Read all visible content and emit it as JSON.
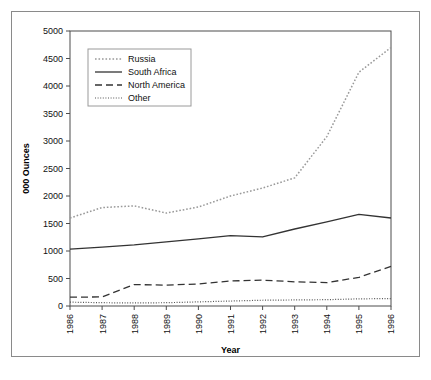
{
  "chart_data": {
    "type": "line",
    "title": "",
    "xlabel": "Year",
    "ylabel": "000 Ounces",
    "xlim": [
      1986,
      1996
    ],
    "ylim": [
      0,
      5000
    ],
    "ytick_step": 500,
    "grid": false,
    "legend_position": "top-left",
    "categories": [
      1986,
      1987,
      1988,
      1989,
      1990,
      1991,
      1992,
      1993,
      1994,
      1995,
      1996
    ],
    "xticklabels": [
      "1986",
      "1987",
      "1988",
      "1989",
      "1990",
      "1991",
      "1992",
      "1993",
      "1994",
      "1995",
      "1996"
    ],
    "yticklabels": [
      "0",
      "500",
      "1000",
      "1500",
      "2000",
      "2500",
      "3000",
      "3500",
      "4000",
      "4500",
      "5000"
    ],
    "series": [
      {
        "name": "Russia",
        "style": "dotted",
        "color": "#999999",
        "values": [
          1600,
          1790,
          1820,
          1690,
          1800,
          2000,
          2145,
          2330,
          3080,
          4250,
          4700
        ]
      },
      {
        "name": "South Africa",
        "style": "solid",
        "color": "#333333",
        "values": [
          1035,
          1070,
          1110,
          1165,
          1220,
          1280,
          1255,
          1400,
          1530,
          1665,
          1600
        ]
      },
      {
        "name": "North America",
        "style": "dashed",
        "color": "#333333",
        "values": [
          160,
          165,
          390,
          380,
          400,
          455,
          470,
          440,
          425,
          520,
          720
        ]
      },
      {
        "name": "Other",
        "style": "fine-dotted",
        "color": "#555555",
        "values": [
          70,
          60,
          55,
          60,
          75,
          90,
          105,
          110,
          115,
          130,
          135
        ]
      }
    ]
  }
}
